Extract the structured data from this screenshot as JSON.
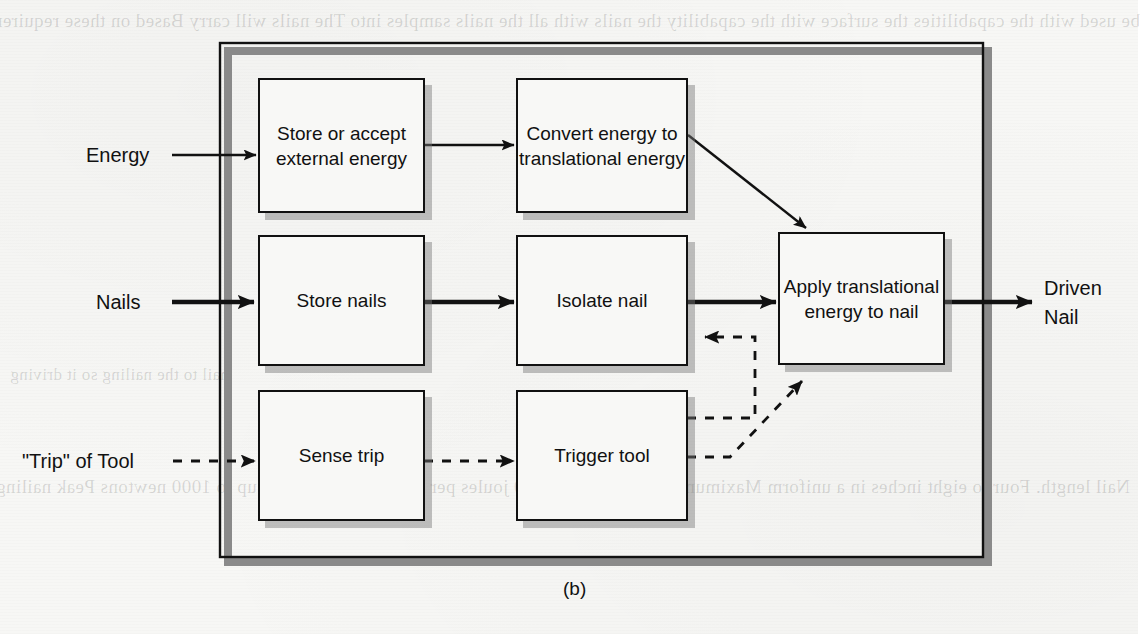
{
  "figure": {
    "caption": "(b)",
    "kind": "functional block diagram",
    "colors": {
      "line": "#111111",
      "box_fill": "#f8f8f6",
      "shadow": "#8a8a8a",
      "page": "#f7f7f5"
    }
  },
  "system_boundary": {
    "label": ""
  },
  "inputs": [
    {
      "id": "energy",
      "label": "Energy",
      "line_style": "solid",
      "weight": "thin"
    },
    {
      "id": "nails",
      "label": "Nails",
      "line_style": "solid",
      "weight": "thick"
    },
    {
      "id": "trip",
      "label": "\"Trip\" of Tool",
      "line_style": "dashed",
      "weight": "thin"
    }
  ],
  "outputs": [
    {
      "id": "driven-nail",
      "label": "Driven\nNail",
      "line_style": "solid",
      "weight": "thick"
    }
  ],
  "blocks": [
    {
      "id": "store-accept-external-energy",
      "label": "Store or\naccept\nexternal\nenergy"
    },
    {
      "id": "convert-energy-to-translational-energy",
      "label": "Convert\nenergy to\ntranslational\nenergy"
    },
    {
      "id": "store-nails",
      "label": "Store\nnails"
    },
    {
      "id": "isolate-nail",
      "label": "Isolate\nnail"
    },
    {
      "id": "apply-translational-energy-to-nail",
      "label": "Apply\ntranslational\nenergy to nail"
    },
    {
      "id": "sense-trip",
      "label": "Sense\ntrip"
    },
    {
      "id": "trigger-tool",
      "label": "Trigger\ntool"
    }
  ],
  "connections": [
    {
      "from": "energy",
      "to": "store-accept-external-energy",
      "style": "solid",
      "weight": "thin"
    },
    {
      "from": "store-accept-external-energy",
      "to": "convert-energy-to-translational-energy",
      "style": "solid",
      "weight": "thin"
    },
    {
      "from": "convert-energy-to-translational-energy",
      "to": "apply-translational-energy-to-nail",
      "style": "solid",
      "weight": "thin"
    },
    {
      "from": "nails",
      "to": "store-nails",
      "style": "solid",
      "weight": "thick"
    },
    {
      "from": "store-nails",
      "to": "isolate-nail",
      "style": "solid",
      "weight": "thick"
    },
    {
      "from": "isolate-nail",
      "to": "apply-translational-energy-to-nail",
      "style": "solid",
      "weight": "thick"
    },
    {
      "from": "apply-translational-energy-to-nail",
      "to": "driven-nail",
      "style": "solid",
      "weight": "thick"
    },
    {
      "from": "trip",
      "to": "sense-trip",
      "style": "dashed",
      "weight": "thin"
    },
    {
      "from": "sense-trip",
      "to": "trigger-tool",
      "style": "dashed",
      "weight": "thin"
    },
    {
      "from": "trigger-tool",
      "to": "isolate-nail",
      "style": "dashed",
      "weight": "thin"
    },
    {
      "from": "trigger-tool",
      "to": "apply-translational-energy-to-nail",
      "style": "dashed",
      "weight": "thin"
    }
  ],
  "bleed_through_text": {
    "col1": [
      "be used with the capabilities",
      "the surface with the capability",
      "the nails with all the nails samples into",
      "The nails will carry",
      "",
      "Based on these requirements and factors for a hand-held",
      "driver. These include:",
      "",
      "drive hammer blows in a rapid succession",
      "that is nailed at a time.",
      "The nails must be able to carry the force along the handle.",
      "",
      "The joint needs to be somewhat intense, hammer and nail is next to work; so has the",
      "the nailing is slowly and the tool be used to. These have greatly seen so as to keep any nailing",
      "into a nail in driven and suitable. It becomes best that all nails the nail so the"
    ],
    "col2": [
      "Nail length. Four to eight inches in a uniform",
      "Maximum nailing energy of 40 joules per nail",
      "Nailing force of up to 1000 newtons",
      "Peak nailing rate of one per one second"
    ]
  }
}
